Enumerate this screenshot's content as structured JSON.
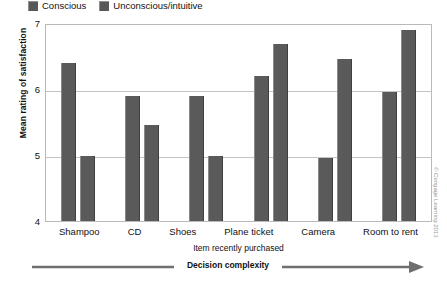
{
  "legend": {
    "position": "top-left",
    "swatch_color": "#585858",
    "entries": [
      {
        "label": "Conscious",
        "icon": "square-swatch-icon"
      },
      {
        "label": "Unconscious/intuitive",
        "icon": "square-swatch-icon"
      }
    ]
  },
  "axes": {
    "ylabel": "Mean rating of satisfaction",
    "xlabel": "Item recently purchased",
    "yticks": [
      "7",
      "6",
      "5",
      "4"
    ]
  },
  "annotation": {
    "complexity_label": "Decision complexity",
    "arrow_direction": "right"
  },
  "credit": "© Cengage Learning 2013",
  "chart_data": {
    "type": "bar",
    "title": "",
    "subtitle": "",
    "xlabel": "Item recently purchased",
    "ylabel": "Mean rating of satisfaction",
    "ylim": [
      4,
      7
    ],
    "yticks": [
      4,
      5,
      6,
      7
    ],
    "grid": true,
    "legend_position": "top-left",
    "categories": [
      "Shampoo",
      "CD",
      "Shoes",
      "Plane ticket",
      "Camera",
      "Room to rent"
    ],
    "series": [
      {
        "name": "Conscious",
        "color": "#5a5a5a",
        "values": [
          6.4,
          5.9,
          5.9,
          6.2,
          4.95,
          5.95
        ]
      },
      {
        "name": "Unconscious/intuitive",
        "color": "#5a5a5a",
        "values": [
          4.98,
          5.45,
          4.98,
          6.68,
          6.45,
          6.9
        ]
      }
    ],
    "annotations": [
      {
        "text": "Decision complexity",
        "type": "arrow",
        "direction": "right",
        "position": "below-x-axis"
      }
    ]
  }
}
